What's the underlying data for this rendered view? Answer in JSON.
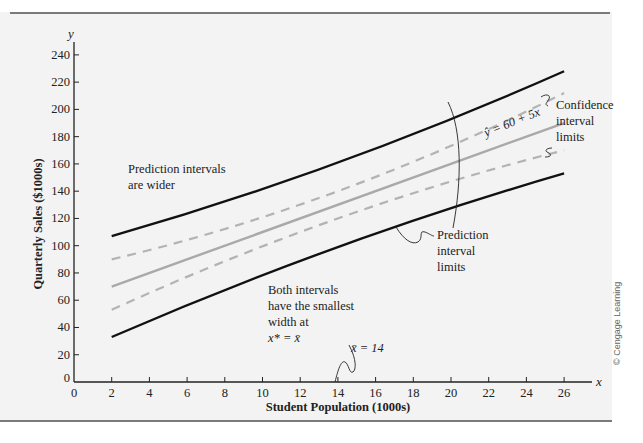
{
  "chart_data": {
    "type": "line",
    "title": "",
    "xlabel": "Student Population (1000s)",
    "ylabel": "Quarterly Sales ($1000s)",
    "x_axis_symbol": "x",
    "y_axis_symbol": "y",
    "xlim": [
      0,
      28
    ],
    "ylim": [
      0,
      250
    ],
    "x_ticks": [
      0,
      2,
      4,
      6,
      8,
      10,
      12,
      14,
      16,
      18,
      20,
      22,
      24,
      26
    ],
    "y_ticks": [
      0,
      20,
      40,
      60,
      80,
      100,
      120,
      140,
      160,
      180,
      200,
      220,
      240
    ],
    "grid": false,
    "x": [
      2,
      26
    ],
    "series": [
      {
        "name": "Regression line ŷ = 60 + 5x",
        "style": "solid-gray",
        "x": [
          2,
          14,
          26
        ],
        "values": [
          70,
          130,
          190
        ]
      },
      {
        "name": "Upper confidence interval limit",
        "style": "dashed-gray",
        "x": [
          2,
          14,
          26
        ],
        "values": [
          90,
          140,
          212
        ]
      },
      {
        "name": "Lower confidence interval limit",
        "style": "dashed-gray",
        "x": [
          2,
          14,
          26
        ],
        "values": [
          53,
          120,
          170
        ]
      },
      {
        "name": "Upper prediction interval limit",
        "style": "solid-black",
        "x": [
          2,
          14,
          26
        ],
        "values": [
          107,
          161,
          228
        ]
      },
      {
        "name": "Lower prediction interval limit",
        "style": "solid-black",
        "x": [
          2,
          14,
          26
        ],
        "values": [
          33,
          99,
          153
        ]
      }
    ],
    "annotations": [
      {
        "text": "Prediction intervals are wider",
        "x": 3,
        "y": 157
      },
      {
        "text": "Both intervals have the smallest width at x* = x̄",
        "x": 11,
        "y": 70
      },
      {
        "text": "x̄ = 14",
        "x": 15.5,
        "y": 27
      },
      {
        "text": "ŷ = 60 + 5x",
        "x": 23,
        "y": 186
      },
      {
        "text": "Confidence interval limits",
        "x": 27,
        "y": 200
      },
      {
        "text": "Prediction interval limits",
        "x": 21.5,
        "y": 120
      }
    ]
  },
  "labels": {
    "y_axis_symbol": "y",
    "x_axis_symbol": "x",
    "y_axis_title": "Quarterly Sales ($1000s)",
    "x_axis_title": "Student Population (1000s)",
    "ann_prediction_wider_1": "Prediction intervals",
    "ann_prediction_wider_2": "are wider",
    "ann_both_1": "Both intervals",
    "ann_both_2": "have the smallest",
    "ann_both_3": "width at",
    "ann_both_4": "x* = x̄",
    "ann_xbar": "x̄  = 14",
    "ann_equation": "ŷ = 60 + 5x",
    "ann_conf_1": "Confidence",
    "ann_conf_2": "interval",
    "ann_conf_3": "limits",
    "ann_pred_1": "Prediction",
    "ann_pred_2": "interval",
    "ann_pred_3": "limits",
    "credit": "© Cengage Learning"
  },
  "colors": {
    "panel_bg": "#f3f3f3",
    "prediction_line": "#111111",
    "regression_line": "#a9a9a9",
    "confidence_line": "#b3b3b3",
    "axis": "#222222"
  }
}
